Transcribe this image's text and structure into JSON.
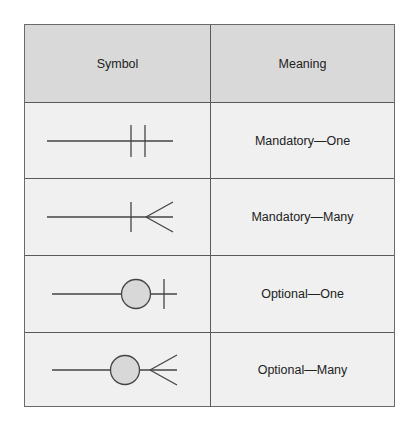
{
  "table": {
    "headers": {
      "symbol": "Symbol",
      "meaning": "Meaning"
    },
    "rows": [
      {
        "symbol": "mandatory-one-icon",
        "meaning": "Mandatory—One"
      },
      {
        "symbol": "mandatory-many-icon",
        "meaning": "Mandatory—Many"
      },
      {
        "symbol": "optional-one-icon",
        "meaning": "Optional—One"
      },
      {
        "symbol": "optional-many-icon",
        "meaning": "Optional—Many"
      }
    ]
  },
  "colors": {
    "header_bg": "#d9d9d9",
    "body_bg": "#f0f0f0",
    "line": "#444444",
    "circle_fill": "#d8d8d8"
  }
}
